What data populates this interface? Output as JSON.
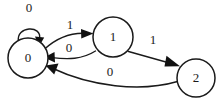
{
  "diagram": {
    "type": "state-transition-diagram",
    "title": "",
    "background_color": "#ffffff",
    "stroke_color": "#1a1a1a",
    "states": [
      {
        "id": "s0",
        "label": "0",
        "cx": 28,
        "cy": 58,
        "r": 20
      },
      {
        "id": "s1",
        "label": "1",
        "cx": 113,
        "cy": 37,
        "r": 20
      },
      {
        "id": "s2",
        "label": "2",
        "cx": 196,
        "cy": 78,
        "r": 19
      }
    ],
    "transitions": [
      {
        "id": "t0",
        "from": "s0",
        "to": "s0",
        "label": "0",
        "label_x": 29,
        "label_y": 9,
        "kind": "self-loop"
      },
      {
        "id": "t1",
        "from": "s0",
        "to": "s1",
        "label": "1",
        "label_x": 70,
        "label_y": 26,
        "kind": "curve"
      },
      {
        "id": "t2",
        "from": "s1",
        "to": "s0",
        "label": "0",
        "label_x": 69,
        "label_y": 49,
        "kind": "curve"
      },
      {
        "id": "t3",
        "from": "s1",
        "to": "s2",
        "label": "1",
        "label_x": 153,
        "label_y": 41,
        "kind": "line"
      },
      {
        "id": "t4",
        "from": "s2",
        "to": "s0",
        "label": "0",
        "label_x": 110,
        "label_y": 73,
        "kind": "curve"
      }
    ]
  }
}
